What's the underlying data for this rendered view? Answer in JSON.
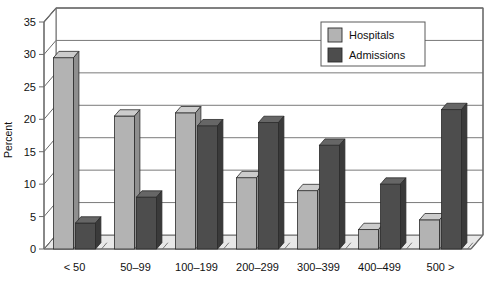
{
  "chart_data": {
    "type": "bar",
    "title": "",
    "subtitle": "",
    "xlabel": "",
    "ylabel": "Percent",
    "ylim": [
      0,
      35
    ],
    "ytick_step": 5,
    "yticks": [
      "0",
      "5",
      "10",
      "15",
      "20",
      "25",
      "30",
      "35"
    ],
    "grid": true,
    "style": "3d-grouped-bar",
    "legend_position": "top-right-inside",
    "categories": [
      "< 50",
      "50–99",
      "100–199",
      "200–299",
      "300–399",
      "400–499",
      "500 >"
    ],
    "series": [
      {
        "name": "Hospitals",
        "color": "#b3b3b3",
        "side_color": "#8f8f8f",
        "top_color": "#cccccc",
        "values": [
          29.5,
          20.5,
          21.0,
          11.0,
          9.0,
          3.0,
          4.5
        ]
      },
      {
        "name": "Admissions",
        "color": "#4d4d4d",
        "side_color": "#3a3a3a",
        "top_color": "#666666",
        "values": [
          4.0,
          8.0,
          19.0,
          19.5,
          16.0,
          10.0,
          21.5
        ]
      }
    ]
  },
  "legend": {
    "items": [
      {
        "label": "Hospitals",
        "swatch": "#b3b3b3"
      },
      {
        "label": "Admissions",
        "swatch": "#4d4d4d"
      }
    ]
  },
  "axis": {
    "y_title": "Percent",
    "y_ticks": [
      "35",
      "30",
      "25",
      "20",
      "15",
      "10",
      "5",
      "0"
    ],
    "x_ticks": [
      "< 50",
      "50–99",
      "100–199",
      "200–299",
      "300–399",
      "400–499",
      "500 >"
    ]
  },
  "colors": {
    "background": "#ffffff",
    "frame": "#6b6b6b",
    "gridline": "#7a7a7a",
    "floor": "#e8e8e8",
    "text": "#111111"
  }
}
